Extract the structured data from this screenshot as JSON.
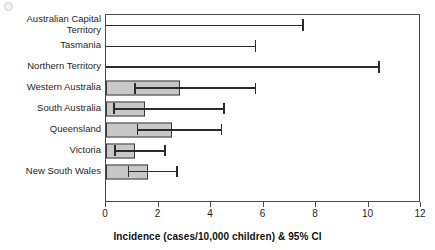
{
  "chart_data": {
    "type": "bar",
    "orientation": "horizontal",
    "title": "",
    "xlabel": "Incidence (cases/10,000 children) & 95% CI",
    "ylabel": "",
    "xlim": [
      0,
      12
    ],
    "xticks": [
      0,
      2,
      4,
      6,
      8,
      10,
      12
    ],
    "xtick_labels": [
      "0",
      "2",
      "4",
      "6",
      "8",
      "10",
      "12"
    ],
    "grid": false,
    "legend": false,
    "error_bars": "95% CI",
    "categories": [
      "Australian Capital Territory",
      "Tasmania",
      "Northern Territory",
      "Western Australia",
      "South Australia",
      "Queensland",
      "Victoria",
      "New South Wales"
    ],
    "category_labels": [
      "Australian Capital\nTerritory",
      "Tasmania",
      "Northern Territory",
      "Western Australia",
      "South Australia",
      "Queensland",
      "Victoria",
      "New South Wales"
    ],
    "values": [
      0.0,
      0.0,
      0.0,
      2.8,
      1.5,
      2.5,
      1.1,
      1.6
    ],
    "ci_lower": [
      0.0,
      0.0,
      0.0,
      1.1,
      0.3,
      1.2,
      0.35,
      0.85
    ],
    "ci_upper": [
      7.5,
      5.7,
      10.4,
      5.7,
      4.5,
      4.4,
      2.25,
      2.7
    ],
    "series": [
      {
        "name": "Incidence (cases/10,000 children)",
        "values": [
          0.0,
          0.0,
          0.0,
          2.8,
          1.5,
          2.5,
          1.1,
          1.6
        ]
      }
    ],
    "bar_fill_color": "#c8c8c8",
    "bar_edge_color": "#3c3c3c",
    "error_bar_color": "#2b2b2b"
  }
}
